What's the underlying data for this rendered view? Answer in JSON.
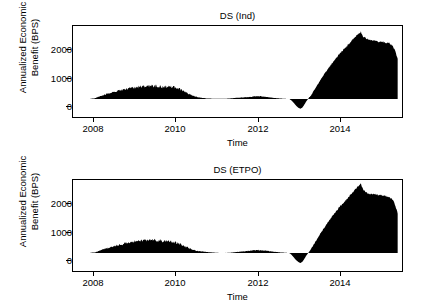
{
  "figure": {
    "xlabel": "Time",
    "ylabel_line1": "Annualized Economic",
    "ylabel_line2": "Benefit (BPS)",
    "ink_color": "#000000"
  },
  "panels": [
    {
      "title": "DS (Ind)"
    },
    {
      "title": "DS (ETPO)"
    }
  ],
  "axes": {
    "y_ticks": [
      "2000",
      "1000",
      "0"
    ],
    "y_tick_values": [
      2000,
      1000,
      0
    ],
    "x_ticks": [
      "2008",
      "2010",
      "2012",
      "2014"
    ],
    "x_tick_values": [
      2008,
      2010,
      2012,
      2014
    ]
  },
  "chart_data": {
    "type": "area",
    "xlabel": "Time",
    "ylabel": "Annualized Economic Benefit (BPS)",
    "xlim": [
      2007.5,
      2015.1
    ],
    "ylim": [
      -700,
      2850
    ],
    "grid": false,
    "legend": "none",
    "subplots": [
      {
        "title": "DS (Ind)",
        "type": "area",
        "baseline": 0,
        "x": [
          2007.9,
          2008.0,
          2008.1,
          2008.2,
          2008.3,
          2008.4,
          2008.5,
          2008.6,
          2008.7,
          2008.8,
          2008.9,
          2009.0,
          2009.1,
          2009.2,
          2009.3,
          2009.4,
          2009.5,
          2009.6,
          2009.7,
          2009.8,
          2009.9,
          2010.0,
          2010.1,
          2010.2,
          2010.3,
          2010.4,
          2010.5,
          2010.6,
          2010.7,
          2010.8,
          2010.9,
          2011.0,
          2011.1,
          2011.2,
          2011.3,
          2011.4,
          2011.5,
          2011.6,
          2011.7,
          2011.8,
          2011.9,
          2012.0,
          2012.1,
          2012.2,
          2012.3,
          2012.4,
          2012.5,
          2012.55,
          2012.6,
          2012.65,
          2012.7,
          2012.75,
          2012.8,
          2012.85,
          2012.9,
          2013.0,
          2013.1,
          2013.2,
          2013.3,
          2013.4,
          2013.5,
          2013.6,
          2013.7,
          2013.8,
          2013.9,
          2014.0,
          2014.1,
          2014.15,
          2014.2,
          2014.3,
          2014.4,
          2014.5,
          2014.6,
          2014.7,
          2014.8,
          2014.9,
          2015.0
        ],
        "y": [
          10,
          30,
          90,
          160,
          210,
          260,
          300,
          330,
          380,
          420,
          450,
          470,
          490,
          500,
          520,
          500,
          490,
          470,
          480,
          470,
          430,
          360,
          270,
          180,
          110,
          70,
          40,
          25,
          15,
          10,
          8,
          10,
          20,
          35,
          50,
          60,
          70,
          85,
          100,
          110,
          95,
          70,
          50,
          35,
          20,
          10,
          0,
          -60,
          -150,
          -250,
          -330,
          -380,
          -330,
          -200,
          -60,
          150,
          430,
          700,
          960,
          1200,
          1430,
          1650,
          1850,
          2020,
          2200,
          2400,
          2580,
          2620,
          2450,
          2330,
          2280,
          2250,
          2230,
          2210,
          2180,
          2050,
          1600
        ],
        "peak": {
          "x": 2014.15,
          "y": 2620
        },
        "trough": {
          "x": 2012.75,
          "y": -380
        },
        "noise_amplitude": 60
      },
      {
        "title": "DS (ETPO)",
        "type": "area",
        "baseline": 0,
        "x": [
          2007.9,
          2008.0,
          2008.1,
          2008.2,
          2008.3,
          2008.4,
          2008.5,
          2008.6,
          2008.7,
          2008.8,
          2008.9,
          2009.0,
          2009.1,
          2009.2,
          2009.3,
          2009.4,
          2009.5,
          2009.6,
          2009.7,
          2009.8,
          2009.9,
          2010.0,
          2010.1,
          2010.2,
          2010.3,
          2010.4,
          2010.5,
          2010.6,
          2010.7,
          2010.8,
          2010.9,
          2011.0,
          2011.1,
          2011.2,
          2011.3,
          2011.4,
          2011.5,
          2011.6,
          2011.7,
          2011.8,
          2011.9,
          2012.0,
          2012.1,
          2012.2,
          2012.3,
          2012.4,
          2012.5,
          2012.55,
          2012.6,
          2012.65,
          2012.7,
          2012.75,
          2012.8,
          2012.85,
          2012.9,
          2013.0,
          2013.1,
          2013.2,
          2013.3,
          2013.4,
          2013.5,
          2013.6,
          2013.7,
          2013.8,
          2013.9,
          2014.0,
          2014.1,
          2014.15,
          2014.2,
          2014.3,
          2014.4,
          2014.5,
          2014.6,
          2014.7,
          2014.8,
          2014.9,
          2015.0
        ],
        "y": [
          10,
          25,
          80,
          150,
          200,
          250,
          290,
          330,
          380,
          430,
          460,
          480,
          500,
          510,
          520,
          500,
          480,
          460,
          460,
          440,
          400,
          330,
          250,
          170,
          110,
          80,
          60,
          40,
          25,
          12,
          5,
          5,
          10,
          25,
          45,
          60,
          75,
          95,
          110,
          115,
          100,
          80,
          60,
          40,
          25,
          12,
          0,
          -70,
          -170,
          -270,
          -340,
          -390,
          -340,
          -210,
          -70,
          160,
          440,
          720,
          980,
          1230,
          1460,
          1680,
          1880,
          2060,
          2250,
          2450,
          2640,
          2680,
          2480,
          2340,
          2300,
          2290,
          2260,
          2230,
          2190,
          2060,
          1550
        ],
        "peak": {
          "x": 2014.15,
          "y": 2680
        },
        "trough": {
          "x": 2012.75,
          "y": -390
        },
        "noise_amplitude": 60
      }
    ]
  }
}
